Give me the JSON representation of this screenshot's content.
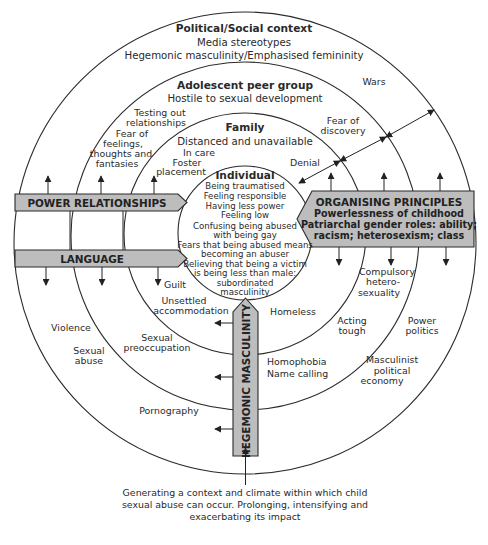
{
  "diagram": {
    "type": "concentric-circles",
    "rings": {
      "political_social": {
        "title": "Political/Social context",
        "lines": [
          "Media stereotypes",
          "Hegemonic masculinity/Emphasised femininity"
        ],
        "items": {
          "wars": "Wars",
          "violence": "Violence",
          "sexual_abuse": [
            "Sexual",
            "abuse"
          ],
          "pornography": "Pornography",
          "power_politics": [
            "Power",
            "politics"
          ],
          "masculinist": [
            "Masculinist",
            "political",
            "economy"
          ]
        }
      },
      "adolescent": {
        "title": "Adolescent peer group",
        "lines": [
          "Hostile to sexual development"
        ],
        "items": {
          "testing": [
            "Testing out",
            "relationships"
          ],
          "fear_feelings": [
            "Fear of",
            "feelings,",
            "thoughts and",
            "fantasies"
          ],
          "fear_discovery": [
            "Fear of",
            "discovery"
          ],
          "sexual_preoccupation": [
            "Sexual",
            "preoccupation"
          ],
          "homophobia": [
            "Homophobia",
            "Name calling"
          ],
          "acting_tough": [
            "Acting",
            "tough"
          ],
          "compulsory": [
            "Compulsory",
            "hetero-",
            "sexuality"
          ]
        }
      },
      "family": {
        "title": "Family",
        "lines": [
          "Distanced and unavailable"
        ],
        "items": {
          "in_care": "In care",
          "foster": [
            "Foster",
            "placement"
          ],
          "denial": "Denial",
          "guilt": "Guilt",
          "unsettled": [
            "Unsettled",
            "accommodation"
          ],
          "homeless": "Homeless"
        }
      },
      "individual": {
        "title": "Individual",
        "lines": [
          "Being traumatised",
          "Feeling responsible",
          "Having less power",
          "Feeling low",
          "Confusing being abused",
          "with being gay",
          "Fears that being abused means",
          "becoming an abuser",
          "Believing that being a victim",
          "is being less than male:",
          "subordinated",
          "masculinity"
        ]
      }
    },
    "arrows": {
      "power": "POWER RELATIONSHIPS",
      "language": "LANGUAGE",
      "organising": {
        "title": "ORGANISING PRINCIPLES",
        "lines": [
          "Powerlessness of childhood",
          "Patriarchal gender roles: ability;",
          "racism; heterosexism; class"
        ]
      },
      "hegemonic": "HEGEMONIC MASCULINITY"
    },
    "caption": [
      "Generating a context and climate within which child",
      "sexual abuse can occur. Prolonging, intensifying and",
      "exacerbating its impact"
    ],
    "colors": {
      "band_fill": "#bdbdbd",
      "stroke": "#2b2b2b",
      "background": "#ffffff"
    }
  }
}
